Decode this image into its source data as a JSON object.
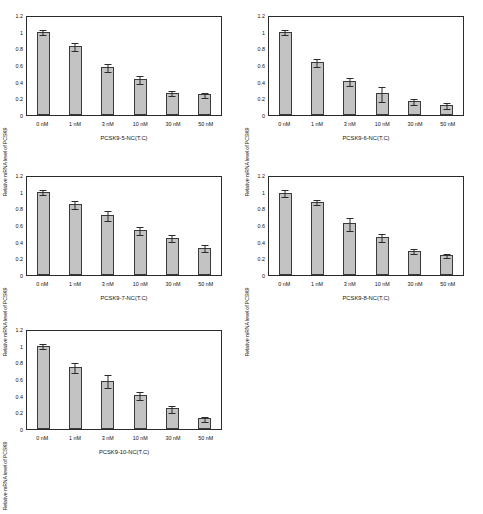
{
  "chart_data": [
    {
      "id": "pcsk9-5",
      "type": "bar",
      "title": "PCSK9-5-NC(T.C)",
      "xlabel": "PCSK9-5-NC(T.C)",
      "ylabel": "Relative mRNA level of PCSK9",
      "categories": [
        "0 nM",
        "1 nM",
        "3 nM",
        "10 nM",
        "30 nM",
        "50 nM"
      ],
      "values": [
        1.0,
        0.83,
        0.58,
        0.43,
        0.27,
        0.25
      ],
      "errors": [
        0.03,
        0.05,
        0.05,
        0.05,
        0.03,
        0.03
      ],
      "yticks": [
        "0",
        "0.2",
        "0.4",
        "0.6",
        "0.8",
        "1",
        "1.2"
      ],
      "ylim": [
        0,
        1.2
      ],
      "grid": false,
      "legend": "none"
    },
    {
      "id": "pcsk9-6",
      "type": "bar",
      "title": "PCSK9-6-NC(T.C)",
      "xlabel": "PCSK9-6-NC(T.C)",
      "ylabel": "Relative mRNA level of PCSK9",
      "categories": [
        "0 nM",
        "1 nM",
        "3 nM",
        "10 nM",
        "30 nM",
        "50 nM"
      ],
      "values": [
        1.0,
        0.64,
        0.41,
        0.26,
        0.17,
        0.12
      ],
      "errors": [
        0.03,
        0.05,
        0.05,
        0.09,
        0.04,
        0.04
      ],
      "yticks": [
        "0",
        "0.2",
        "0.4",
        "0.6",
        "0.8",
        "1",
        "1.2"
      ],
      "ylim": [
        0,
        1.2
      ],
      "grid": false,
      "legend": "none"
    },
    {
      "id": "pcsk9-7",
      "type": "bar",
      "title": "PCSK9-7-NC(T.C)",
      "xlabel": "PCSK9-7-NC(T.C)",
      "ylabel": "Relative mRNA level of PCSK9",
      "categories": [
        "0 nM",
        "1 nM",
        "3 nM",
        "10 nM",
        "30 nM",
        "50 nM"
      ],
      "values": [
        1.0,
        0.85,
        0.72,
        0.54,
        0.45,
        0.33
      ],
      "errors": [
        0.03,
        0.05,
        0.06,
        0.05,
        0.04,
        0.04
      ],
      "yticks": [
        "0",
        "0.2",
        "0.4",
        "0.6",
        "0.8",
        "1",
        "1.2"
      ],
      "ylim": [
        0,
        1.2
      ],
      "grid": false,
      "legend": "none"
    },
    {
      "id": "pcsk9-8",
      "type": "bar",
      "title": "PCSK9-8-NC(T.C)",
      "xlabel": "PCSK9-8-NC(T.C)",
      "ylabel": "Relative mRNA level of PCSK9",
      "categories": [
        "0 nM",
        "1 nM",
        "3 nM",
        "10 nM",
        "30 nM",
        "50 nM"
      ],
      "values": [
        0.99,
        0.88,
        0.62,
        0.46,
        0.29,
        0.24
      ],
      "errors": [
        0.04,
        0.03,
        0.08,
        0.05,
        0.03,
        0.02
      ],
      "yticks": [
        "0",
        "0.2",
        "0.4",
        "0.6",
        "0.8",
        "1",
        "1.2"
      ],
      "ylim": [
        0,
        1.2
      ],
      "grid": false,
      "legend": "none"
    },
    {
      "id": "pcsk9-10",
      "type": "bar",
      "title": "PCSK9-10-NC(T.C)",
      "xlabel": "PCSK9-10-NC(T.C)",
      "ylabel": "Relative mRNA level of PCSK9",
      "categories": [
        "0 nM",
        "1 nM",
        "3 nM",
        "10 nM",
        "30 nM",
        "50 nM"
      ],
      "values": [
        1.0,
        0.74,
        0.58,
        0.41,
        0.25,
        0.13
      ],
      "errors": [
        0.03,
        0.06,
        0.08,
        0.05,
        0.04,
        0.03
      ],
      "yticks": [
        "0",
        "0.2",
        "0.4",
        "0.6",
        "0.8",
        "1",
        "1.2"
      ],
      "ylim": [
        0,
        1.2
      ],
      "grid": false,
      "legend": "none"
    }
  ],
  "style": {
    "bar_fill": "#c3c3c3",
    "bar_stroke": "#3a3a3a",
    "axis_color": "#2b2b2b",
    "background": "#ffffff"
  }
}
